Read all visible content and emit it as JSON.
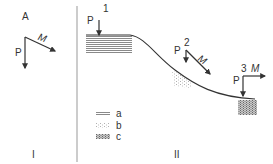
{
  "panels": [
    {
      "id": "I",
      "label": "I"
    },
    {
      "id": "II",
      "label": "II"
    }
  ],
  "panel_I": {
    "point_label": "A",
    "vector_vertical": "P",
    "vector_oblique": "M"
  },
  "panel_II": {
    "stations": [
      {
        "number": "1",
        "vertical": "P"
      },
      {
        "number": "2",
        "vertical": "P",
        "oblique": "M"
      },
      {
        "number": "3",
        "vertical": "P",
        "horizontal": "M"
      }
    ],
    "legend": [
      {
        "key": "a",
        "pattern": "horizontal-lines"
      },
      {
        "key": "b",
        "pattern": "sparse-dots"
      },
      {
        "key": "c",
        "pattern": "dense-stipple"
      }
    ]
  },
  "colors": {
    "line": "#333333",
    "hatch": "#888888",
    "divider": "#999999"
  }
}
